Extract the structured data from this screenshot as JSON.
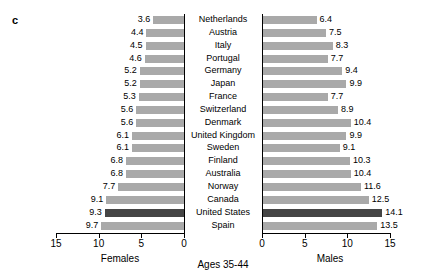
{
  "panel": {
    "label": "c"
  },
  "caption": {
    "center": "Ages 35-44"
  },
  "axes": {
    "left_title": "Females",
    "right_title": "Males",
    "left_ticks": [
      "15",
      "10",
      "5",
      "0"
    ],
    "right_ticks": [
      "0",
      "5",
      "10",
      "15"
    ]
  },
  "colors": {
    "bar": "#a9a9a9",
    "highlight": "#454545",
    "axis": "#000000"
  },
  "chart_data": {
    "type": "bar",
    "title": "Ages 35-44",
    "orientation": "horizontal",
    "layout": "back-to-back population pyramid",
    "grid": false,
    "legend": "none",
    "xlabel_left": "Females",
    "xlabel_right": "Males",
    "ylabel": "",
    "xlim_left": [
      15,
      0
    ],
    "xlim_right": [
      0,
      15
    ],
    "left_tick_values": [
      15,
      10,
      5,
      0
    ],
    "right_tick_values": [
      0,
      5,
      10,
      15
    ],
    "highlight_category": "United States",
    "categories": [
      "Netherlands",
      "Austria",
      "Italy",
      "Portugal",
      "Germany",
      "Japan",
      "France",
      "Switzerland",
      "Denmark",
      "United Kingdom",
      "Sweden",
      "Finland",
      "Australia",
      "Norway",
      "Canada",
      "United States",
      "Spain"
    ],
    "series": [
      {
        "name": "Females",
        "values": [
          3.6,
          4.4,
          4.5,
          4.6,
          5.2,
          5.2,
          5.3,
          5.6,
          5.6,
          6.1,
          6.1,
          6.8,
          6.8,
          7.7,
          9.1,
          9.3,
          9.7
        ],
        "labels": [
          "3.6",
          "4.4",
          "4.5",
          "4.6",
          "5.2",
          "5.2",
          "5.3",
          "5.6",
          "5.6",
          "6.1",
          "6.1",
          "6.8",
          "6.8",
          "7.7",
          "9.1",
          "9.3",
          "9.7"
        ]
      },
      {
        "name": "Males",
        "values": [
          6.4,
          7.5,
          8.3,
          7.7,
          9.4,
          9.9,
          7.7,
          8.9,
          10.4,
          9.9,
          9.1,
          10.3,
          10.4,
          11.6,
          12.5,
          14.1,
          13.5
        ],
        "labels": [
          "6.4",
          "7.5",
          "8.3",
          "7.7",
          "9.4",
          "9.9",
          "7.7",
          "8.9",
          "10.4",
          "9.9",
          "9.1",
          "10.3",
          "10.4",
          "11.6",
          "12.5",
          "14.1",
          "13.5"
        ]
      }
    ]
  }
}
